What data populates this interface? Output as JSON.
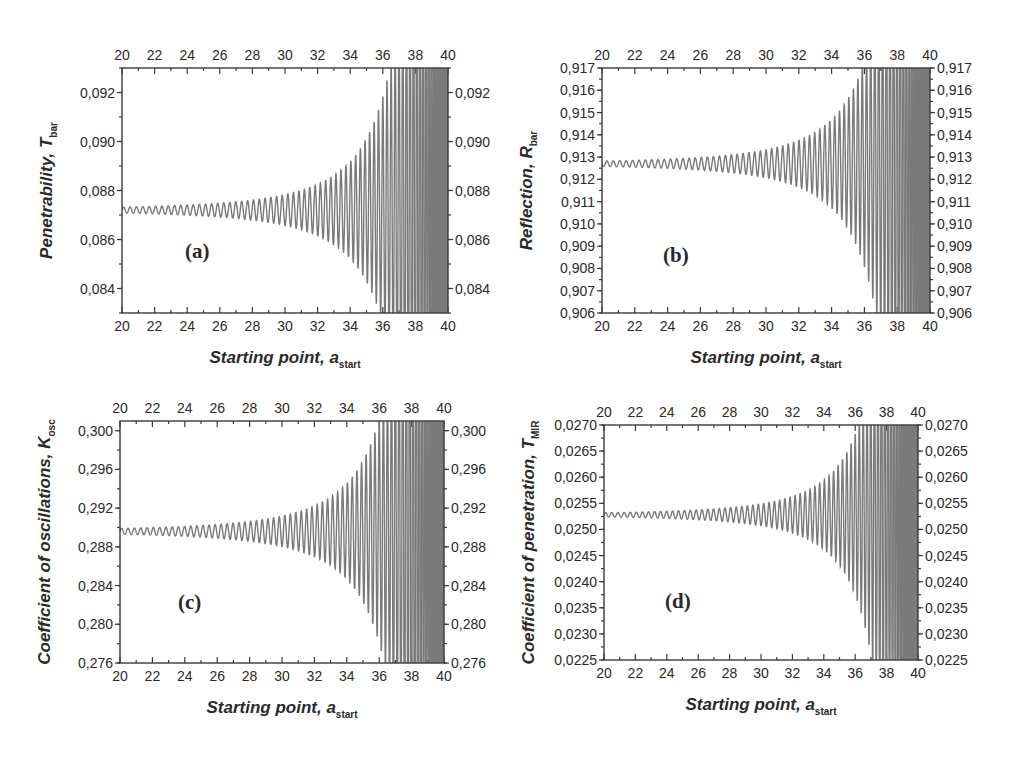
{
  "figure": {
    "background": "#ffffff",
    "line_color": "#7a7a7a",
    "axis_color": "#3a3a3a"
  },
  "chart_data": [
    {
      "type": "line",
      "panel_label": "(a)",
      "title": "",
      "xlabel": "Starting point, a",
      "xlabel_sub": "start",
      "ylabel": "Penetrability, T",
      "ylabel_sub": "bar",
      "xlim": [
        20,
        40
      ],
      "ylim": [
        0.083,
        0.093
      ],
      "x_ticks": [
        "20",
        "22",
        "24",
        "26",
        "28",
        "30",
        "32",
        "34",
        "36",
        "38",
        "40"
      ],
      "y_ticks": [
        {
          "value": 0.084,
          "label": "0,084"
        },
        {
          "value": 0.086,
          "label": "0,086"
        },
        {
          "value": 0.088,
          "label": "0,088"
        },
        {
          "value": 0.09,
          "label": "0,090"
        },
        {
          "value": 0.092,
          "label": "0,092"
        }
      ],
      "y_minor_step": 0.001,
      "mirror_axes": true,
      "grid": false,
      "series": [
        {
          "name": "T_bar",
          "baseline": 0.0872,
          "start_amplitude": 0.00012,
          "phase_sign": 1,
          "key_points": [
            {
              "x": 20,
              "y": 0.0872
            },
            {
              "x": 30,
              "y": 0.0876
            },
            {
              "x": 36.3,
              "y": 0.0856
            },
            {
              "x": 37.7,
              "y": 0.0902
            },
            {
              "x": 38.3,
              "y": 0.0835
            },
            {
              "x": 38.9,
              "y": 0.093
            },
            {
              "x": 39.4,
              "y": 0.083
            }
          ]
        }
      ],
      "layout": {
        "left": 122,
        "top": 68,
        "right": 448,
        "bottom": 313,
        "label_x": 185,
        "label_y": 258
      }
    },
    {
      "type": "line",
      "panel_label": "(b)",
      "title": "",
      "xlabel": "Starting point, a",
      "xlabel_sub": "start",
      "ylabel": "Reflection, R",
      "ylabel_sub": "bar",
      "xlim": [
        20,
        40
      ],
      "ylim": [
        0.906,
        0.917
      ],
      "x_ticks": [
        "20",
        "22",
        "24",
        "26",
        "28",
        "30",
        "32",
        "34",
        "36",
        "38",
        "40"
      ],
      "y_ticks": [
        {
          "value": 0.906,
          "label": "0,906"
        },
        {
          "value": 0.907,
          "label": "0,907"
        },
        {
          "value": 0.908,
          "label": "0,908"
        },
        {
          "value": 0.909,
          "label": "0,909"
        },
        {
          "value": 0.91,
          "label": "0,910"
        },
        {
          "value": 0.911,
          "label": "0,911"
        },
        {
          "value": 0.912,
          "label": "0,912"
        },
        {
          "value": 0.913,
          "label": "0,913"
        },
        {
          "value": 0.914,
          "label": "0,914"
        },
        {
          "value": 0.915,
          "label": "0,915"
        },
        {
          "value": 0.916,
          "label": "0,916"
        },
        {
          "value": 0.917,
          "label": "0,917"
        }
      ],
      "y_minor_step": 0.0005,
      "mirror_axes": true,
      "grid": false,
      "series": [
        {
          "name": "R_bar",
          "baseline": 0.9127,
          "start_amplitude": 0.00012,
          "phase_sign": -1,
          "key_points": [
            {
              "x": 20,
              "y": 0.9127
            },
            {
              "x": 30,
              "y": 0.913
            },
            {
              "x": 36.3,
              "y": 0.9144
            },
            {
              "x": 37.2,
              "y": 0.915
            },
            {
              "x": 37.7,
              "y": 0.9098
            },
            {
              "x": 38.3,
              "y": 0.9165
            },
            {
              "x": 38.9,
              "y": 0.907
            },
            {
              "x": 39.4,
              "y": 0.917
            }
          ]
        }
      ],
      "layout": {
        "left": 602,
        "top": 68,
        "right": 930,
        "bottom": 313,
        "label_x": 663,
        "label_y": 262
      }
    },
    {
      "type": "line",
      "panel_label": "(c)",
      "title": "",
      "xlabel": "Starting point, a",
      "xlabel_sub": "start",
      "ylabel": "Coefficient of oscillations, K",
      "ylabel_sub": "osc",
      "xlim": [
        20,
        40
      ],
      "ylim": [
        0.276,
        0.301
      ],
      "x_ticks": [
        "20",
        "22",
        "24",
        "26",
        "28",
        "30",
        "32",
        "34",
        "36",
        "38",
        "40"
      ],
      "y_ticks": [
        {
          "value": 0.276,
          "label": "0,276"
        },
        {
          "value": 0.28,
          "label": "0,280"
        },
        {
          "value": 0.284,
          "label": "0,284"
        },
        {
          "value": 0.288,
          "label": "0,288"
        },
        {
          "value": 0.292,
          "label": "0,292"
        },
        {
          "value": 0.296,
          "label": "0,296"
        },
        {
          "value": 0.3,
          "label": "0,300"
        }
      ],
      "y_minor_step": 0.002,
      "mirror_axes": true,
      "grid": false,
      "series": [
        {
          "name": "K_osc",
          "baseline": 0.2896,
          "start_amplitude": 0.0003,
          "phase_sign": 1,
          "key_points": [
            {
              "x": 20,
              "y": 0.2896
            },
            {
              "x": 30,
              "y": 0.29
            },
            {
              "x": 36.5,
              "y": 0.2935
            },
            {
              "x": 37.4,
              "y": 0.2953
            },
            {
              "x": 37.9,
              "y": 0.2832
            },
            {
              "x": 38.5,
              "y": 0.3
            },
            {
              "x": 39.2,
              "y": 0.2768
            },
            {
              "x": 39.8,
              "y": 0.301
            }
          ]
        }
      ],
      "layout": {
        "left": 120,
        "top": 421,
        "right": 444,
        "bottom": 663,
        "label_x": 178,
        "label_y": 609
      }
    },
    {
      "type": "line",
      "panel_label": "(d)",
      "title": "",
      "xlabel": "Starting point, a",
      "xlabel_sub": "start",
      "ylabel": "Coefficient of penetration, T",
      "ylabel_sub": "MIR",
      "xlim": [
        20,
        40
      ],
      "ylim": [
        0.0225,
        0.027
      ],
      "x_ticks": [
        "20",
        "22",
        "24",
        "26",
        "28",
        "30",
        "32",
        "34",
        "36",
        "38",
        "40"
      ],
      "y_ticks": [
        {
          "value": 0.0225,
          "label": "0,0225"
        },
        {
          "value": 0.023,
          "label": "0,0230"
        },
        {
          "value": 0.0235,
          "label": "0,0235"
        },
        {
          "value": 0.024,
          "label": "0,0240"
        },
        {
          "value": 0.0245,
          "label": "0,0245"
        },
        {
          "value": 0.025,
          "label": "0,0250"
        },
        {
          "value": 0.0255,
          "label": "0,0255"
        },
        {
          "value": 0.026,
          "label": "0,0260"
        },
        {
          "value": 0.0265,
          "label": "0,0265"
        },
        {
          "value": 0.027,
          "label": "0,0270"
        }
      ],
      "y_minor_step": 0.00025,
      "mirror_axes": true,
      "grid": false,
      "series": [
        {
          "name": "T_MIR",
          "baseline": 0.02528,
          "start_amplitude": 4e-05,
          "phase_sign": 1,
          "key_points": [
            {
              "x": 20,
              "y": 0.02528
            },
            {
              "x": 30,
              "y": 0.02535
            },
            {
              "x": 36.7,
              "y": 0.02585
            },
            {
              "x": 37.2,
              "y": 0.02462
            },
            {
              "x": 37.6,
              "y": 0.02613
            },
            {
              "x": 38.1,
              "y": 0.02421
            },
            {
              "x": 38.8,
              "y": 0.0269
            },
            {
              "x": 39.6,
              "y": 0.02275
            },
            {
              "x": 40,
              "y": 0.0262
            }
          ]
        }
      ],
      "layout": {
        "left": 604,
        "top": 425,
        "right": 918,
        "bottom": 660,
        "label_x": 665,
        "label_y": 608
      }
    }
  ]
}
